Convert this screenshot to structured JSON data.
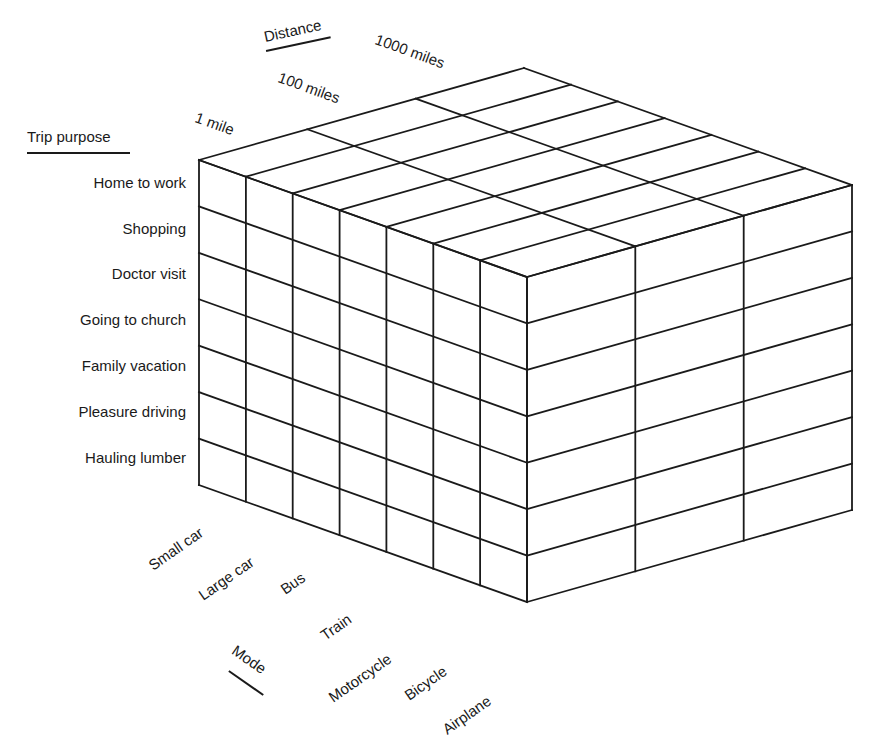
{
  "diagram": {
    "axes": {
      "purpose": {
        "title": "Trip purpose",
        "items": [
          "Home to work",
          "Shopping",
          "Doctor visit",
          "Going to church",
          "Family vacation",
          "Pleasure driving",
          "Hauling lumber"
        ]
      },
      "mode": {
        "title": "Mode",
        "items": [
          "Small car",
          "Large car",
          "Bus",
          "Train",
          "Motorcycle",
          "Bicycle",
          "Airplane"
        ]
      },
      "distance": {
        "title": "Distance",
        "items": [
          "1 mile",
          "100 miles",
          "1000 miles"
        ]
      }
    },
    "grid": {
      "purpose_count": 7,
      "mode_count": 7,
      "distance_count": 3
    },
    "line_color": "#1a1a1a"
  }
}
